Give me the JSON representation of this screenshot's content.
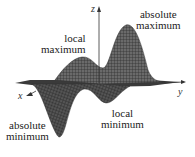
{
  "figure": {
    "type": "3D surface plot with extrema",
    "axes": {
      "x": "x",
      "y": "y",
      "z": "z"
    },
    "labels": {
      "absolute_maximum": [
        "absolute",
        "maximum"
      ],
      "local_maximum": [
        "local",
        "maximum"
      ],
      "absolute_minimum": [
        "absolute",
        "minimum"
      ],
      "local_minimum": [
        "local",
        "minimum"
      ]
    },
    "colors": {
      "surface": "#555555",
      "mesh": "#222222",
      "text": "#222222",
      "background": "#ffffff"
    }
  }
}
